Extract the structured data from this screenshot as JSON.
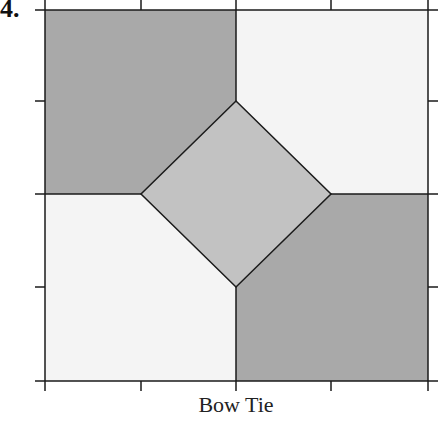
{
  "problem": {
    "number": "4."
  },
  "caption": "Bow Tie",
  "colors": {
    "dark_patch": "#a9a9a9",
    "light_patch": "#f4f4f4",
    "center_diamond": "#c2c2c2",
    "line": "#1a1a1a"
  },
  "grid": {
    "left": 45,
    "right": 428,
    "top": 10,
    "bottom": 381,
    "center_x": 236,
    "center_y": 194,
    "tick_x": [
      141,
      331
    ],
    "tick_y": [
      101,
      287
    ]
  },
  "diamond": {
    "top": [
      236,
      101
    ],
    "left": [
      141,
      194
    ],
    "right": [
      331,
      194
    ],
    "bottom": [
      236,
      287
    ]
  }
}
